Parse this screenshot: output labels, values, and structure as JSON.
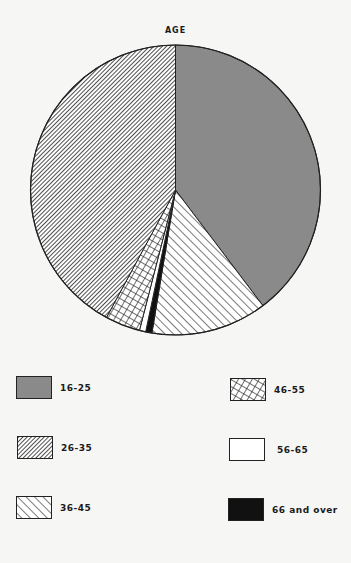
{
  "chart_data": {
    "type": "pie",
    "title": "AGE",
    "start_angle_deg": 0,
    "direction": "clockwise",
    "categories": [
      "16-25",
      "36-45",
      "66 and over",
      "56-65",
      "46-55",
      "26-35"
    ],
    "values": [
      39.7,
      12.9,
      0.7,
      0.7,
      3.9,
      42.1
    ],
    "unit": "percent (estimated from slice angles)",
    "slices": [
      {
        "label": "16-25",
        "value": 39.7,
        "fill": "gray",
        "color": "#8a8a8a",
        "pattern": "solid"
      },
      {
        "label": "36-45",
        "value": 12.9,
        "fill": "wide-backslash-hatch",
        "color": "#ffffff",
        "pattern": "hatch-wide"
      },
      {
        "label": "66 and over",
        "value": 0.7,
        "fill": "black",
        "color": "#111111",
        "pattern": "solid"
      },
      {
        "label": "56-65",
        "value": 0.7,
        "fill": "white",
        "color": "#ffffff",
        "pattern": "solid"
      },
      {
        "label": "46-55",
        "value": 3.9,
        "fill": "crosshatch",
        "color": "#ffffff",
        "pattern": "crosshatch"
      },
      {
        "label": "26-35",
        "value": 42.1,
        "fill": "dense-slash-hatch",
        "color": "#ffffff",
        "pattern": "hatch-dense"
      }
    ],
    "legend": {
      "position": "bottom",
      "columns": 2,
      "entries": [
        {
          "label": "16-25",
          "pattern": "solid-gray"
        },
        {
          "label": "26-35",
          "pattern": "hatch-dense"
        },
        {
          "label": "36-45",
          "pattern": "hatch-wide"
        },
        {
          "label": "46-55",
          "pattern": "crosshatch"
        },
        {
          "label": "56-65",
          "pattern": "solid-white"
        },
        {
          "label": "66 and over",
          "pattern": "solid-black"
        }
      ]
    }
  },
  "title": "AGE",
  "legend": {
    "left": [
      {
        "label": "16-25"
      },
      {
        "label": "26-35"
      },
      {
        "label": "36-45"
      }
    ],
    "right": [
      {
        "label": "46-55"
      },
      {
        "label": "56-65"
      },
      {
        "label": "66 and over"
      }
    ]
  },
  "colors": {
    "gray": "#8a8a8a",
    "ink": "#1a1a1a",
    "paper": "#f6f6f4"
  }
}
